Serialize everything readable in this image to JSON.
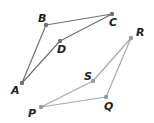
{
  "figure": {
    "width": 154,
    "height": 123,
    "background": "#ffffff"
  },
  "quadrilaterals": [
    {
      "name": "ABCD",
      "stroke": "#707070",
      "point_fill": "#707070",
      "vertices": [
        {
          "label": "A",
          "x": 22,
          "y": 83,
          "label_x": 11,
          "label_y": 94
        },
        {
          "label": "B",
          "x": 46,
          "y": 25,
          "label_x": 38,
          "label_y": 22
        },
        {
          "label": "C",
          "x": 112,
          "y": 14,
          "label_x": 109,
          "label_y": 26
        },
        {
          "label": "D",
          "x": 60,
          "y": 41,
          "label_x": 57,
          "label_y": 53
        }
      ]
    },
    {
      "name": "PQRS",
      "stroke": "#a8a8a8",
      "point_fill": "#9a9a9a",
      "vertices": [
        {
          "label": "P",
          "x": 41,
          "y": 107,
          "label_x": 28,
          "label_y": 117
        },
        {
          "label": "Q",
          "x": 106,
          "y": 97,
          "label_x": 104,
          "label_y": 110
        },
        {
          "label": "R",
          "x": 131,
          "y": 38,
          "label_x": 136,
          "label_y": 36
        },
        {
          "label": "S",
          "x": 93,
          "y": 81,
          "label_x": 84,
          "label_y": 80
        }
      ]
    }
  ]
}
